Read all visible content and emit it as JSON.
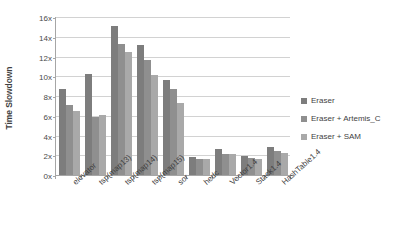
{
  "chart_data": {
    "type": "bar",
    "title": "",
    "subtitle": "",
    "xlabel": "",
    "ylabel": "Time Slowdown",
    "ylim": [
      0,
      16
    ],
    "ytick_values": [
      0,
      2,
      4,
      6,
      8,
      10,
      12,
      14,
      16
    ],
    "ytick_labels": [
      "0x",
      "2x",
      "4x",
      "6x",
      "8x",
      "10x",
      "12x",
      "14x",
      "16x"
    ],
    "grid": "horizontal",
    "legend_position": "right",
    "categories": [
      "elevator",
      "tsp(map13)",
      "tsp(map14)",
      "tsp(map15)",
      "sor",
      "hedc",
      "Vector1.4",
      "Stack1.4",
      "HashTable1.4"
    ],
    "series": [
      {
        "name": "Eraser",
        "color": "#7d7d7d",
        "values": [
          8.7,
          10.2,
          15.1,
          13.2,
          9.6,
          1.8,
          2.6,
          1.9,
          2.8
        ]
      },
      {
        "name": "Eraser + Artemis_C",
        "color": "#8f8f8f",
        "values": [
          7.1,
          5.9,
          13.3,
          11.6,
          8.7,
          1.6,
          2.1,
          1.7,
          2.4
        ]
      },
      {
        "name": "Eraser + SAM",
        "color": "#a9a9a9",
        "values": [
          6.5,
          6.1,
          12.5,
          10.1,
          7.3,
          1.6,
          2.15,
          1.6,
          2.2
        ]
      }
    ]
  },
  "axis": {
    "y_title": "Time Slowdown"
  },
  "colors": {
    "series_eraser": "#7d7d7d",
    "series_artemis": "#8f8f8f",
    "series_sam": "#a9a9a9",
    "gridline": "#d2d2d2",
    "axis": "#a6a6a6",
    "text": "#3f3f3f",
    "background": "#ffffff"
  }
}
